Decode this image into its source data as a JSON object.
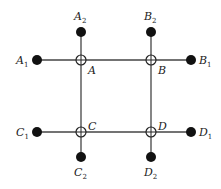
{
  "diagram": {
    "type": "grid-network",
    "colors": {
      "line": "#444444",
      "dot": "#111111",
      "ring": "#222222",
      "background": "#ffffff"
    },
    "junctions": [
      {
        "id": "A",
        "label": "A",
        "x": 81,
        "y": 60
      },
      {
        "id": "B",
        "label": "B",
        "x": 151,
        "y": 60
      },
      {
        "id": "C",
        "label": "C",
        "x": 81,
        "y": 132
      },
      {
        "id": "D",
        "label": "D",
        "x": 151,
        "y": 132
      }
    ],
    "terminals": [
      {
        "id": "A1",
        "base": "A",
        "sub": "1",
        "x": 37,
        "y": 60
      },
      {
        "id": "A2",
        "base": "A",
        "sub": "2",
        "x": 81,
        "y": 32
      },
      {
        "id": "B1",
        "base": "B",
        "sub": "1",
        "x": 191,
        "y": 60
      },
      {
        "id": "B2",
        "base": "B",
        "sub": "2",
        "x": 151,
        "y": 32
      },
      {
        "id": "C1",
        "base": "C",
        "sub": "1",
        "x": 37,
        "y": 132
      },
      {
        "id": "C2",
        "base": "C",
        "sub": "2",
        "x": 81,
        "y": 157
      },
      {
        "id": "D1",
        "base": "D",
        "sub": "1",
        "x": 191,
        "y": 132
      },
      {
        "id": "D2",
        "base": "D",
        "sub": "2",
        "x": 151,
        "y": 157
      }
    ],
    "labels": {
      "A": "A",
      "B": "B",
      "C": "C",
      "D": "D",
      "A1_base": "A",
      "A1_sub": "1",
      "A2_base": "A",
      "A2_sub": "2",
      "B1_base": "B",
      "B1_sub": "1",
      "B2_base": "B",
      "B2_sub": "2",
      "C1_base": "C",
      "C1_sub": "1",
      "C2_base": "C",
      "C2_sub": "2",
      "D1_base": "D",
      "D1_sub": "1",
      "D2_base": "D",
      "D2_sub": "2"
    }
  }
}
